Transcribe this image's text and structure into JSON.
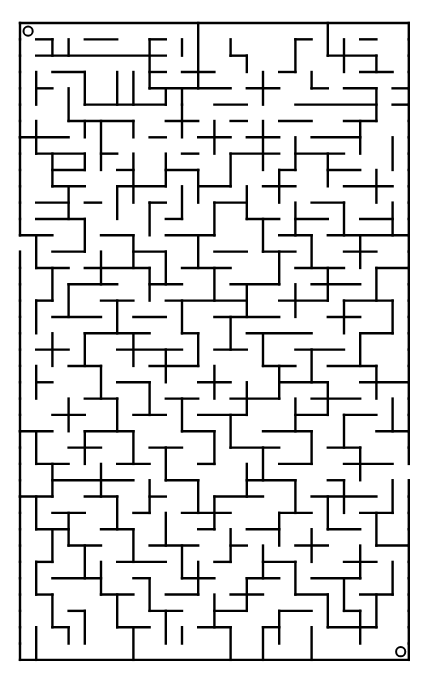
{
  "maze": {
    "cols": 24,
    "rows": 39,
    "origin": [
      20,
      23
    ],
    "cell_w": 16.2,
    "cell_h": 16.33,
    "colors": {
      "wall": "#000000",
      "background": "#ffffff"
    },
    "start_marker": {
      "cell": [
        0,
        0
      ],
      "shape": "circle"
    },
    "end_marker": {
      "cell": [
        23,
        38
      ],
      "shape": "circle"
    },
    "entrance_gaps": [
      {
        "side": "left",
        "row": 13
      },
      {
        "side": "right",
        "row": 27
      }
    ],
    "h_walls": [
      [
        1,
        1,
        2
      ],
      [
        4,
        1,
        6
      ],
      [
        8,
        1,
        9
      ],
      [
        17,
        1,
        18
      ],
      [
        21,
        1,
        22
      ],
      [
        1,
        2,
        9
      ],
      [
        13,
        2,
        14
      ],
      [
        19,
        2,
        22
      ],
      [
        2,
        3,
        4
      ],
      [
        8,
        3,
        9
      ],
      [
        10,
        3,
        12
      ],
      [
        16,
        3,
        17
      ],
      [
        21,
        3,
        23
      ],
      [
        1,
        4,
        2
      ],
      [
        8,
        4,
        13
      ],
      [
        14,
        4,
        16
      ],
      [
        18,
        4,
        19
      ],
      [
        20,
        4,
        22
      ],
      [
        23,
        4,
        24
      ],
      [
        4,
        5,
        9
      ],
      [
        12,
        5,
        14
      ],
      [
        17,
        5,
        22
      ],
      [
        23,
        5,
        24
      ],
      [
        3,
        6,
        7
      ],
      [
        9,
        6,
        11
      ],
      [
        13,
        6,
        14
      ],
      [
        16,
        6,
        18
      ],
      [
        20,
        6,
        22
      ],
      [
        0,
        7,
        3
      ],
      [
        8,
        7,
        9
      ],
      [
        11,
        7,
        13
      ],
      [
        14,
        7,
        16
      ],
      [
        18,
        7,
        21
      ],
      [
        1,
        8,
        4
      ],
      [
        5,
        8,
        6
      ],
      [
        10,
        8,
        11
      ],
      [
        13,
        8,
        16
      ],
      [
        17,
        8,
        20
      ],
      [
        2,
        9,
        4
      ],
      [
        6,
        9,
        7
      ],
      [
        9,
        9,
        11
      ],
      [
        16,
        9,
        17
      ],
      [
        19,
        9,
        21
      ],
      [
        2,
        10,
        4
      ],
      [
        6,
        10,
        9
      ],
      [
        11,
        10,
        13
      ],
      [
        15,
        10,
        17
      ],
      [
        20,
        10,
        23
      ],
      [
        1,
        11,
        3
      ],
      [
        4,
        11,
        5
      ],
      [
        8,
        11,
        9
      ],
      [
        12,
        11,
        14
      ],
      [
        18,
        11,
        20
      ],
      [
        1,
        12,
        4
      ],
      [
        9,
        12,
        10
      ],
      [
        14,
        12,
        16
      ],
      [
        17,
        12,
        19
      ],
      [
        21,
        12,
        23
      ],
      [
        0,
        13,
        2
      ],
      [
        5,
        13,
        7
      ],
      [
        9,
        13,
        12
      ],
      [
        16,
        13,
        18
      ],
      [
        19,
        13,
        24
      ],
      [
        2,
        14,
        4
      ],
      [
        7,
        14,
        9
      ],
      [
        12,
        14,
        14
      ],
      [
        15,
        14,
        17
      ],
      [
        20,
        14,
        22
      ],
      [
        1,
        15,
        3
      ],
      [
        4,
        15,
        8
      ],
      [
        10,
        15,
        13
      ],
      [
        17,
        15,
        20
      ],
      [
        22,
        15,
        24
      ],
      [
        3,
        16,
        6
      ],
      [
        8,
        16,
        10
      ],
      [
        13,
        16,
        16
      ],
      [
        18,
        16,
        21
      ],
      [
        1,
        17,
        2
      ],
      [
        5,
        17,
        7
      ],
      [
        9,
        17,
        14
      ],
      [
        16,
        17,
        19
      ],
      [
        20,
        17,
        23
      ],
      [
        2,
        18,
        5
      ],
      [
        7,
        18,
        9
      ],
      [
        12,
        18,
        16
      ],
      [
        19,
        18,
        21
      ],
      [
        4,
        19,
        8
      ],
      [
        10,
        19,
        11
      ],
      [
        14,
        19,
        18
      ],
      [
        21,
        19,
        23
      ],
      [
        1,
        20,
        3
      ],
      [
        6,
        20,
        10
      ],
      [
        12,
        20,
        14
      ],
      [
        17,
        20,
        20
      ],
      [
        3,
        21,
        5
      ],
      [
        8,
        21,
        11
      ],
      [
        15,
        21,
        17
      ],
      [
        19,
        21,
        22
      ],
      [
        1,
        22,
        2
      ],
      [
        6,
        22,
        8
      ],
      [
        11,
        22,
        13
      ],
      [
        16,
        22,
        19
      ],
      [
        21,
        22,
        24
      ],
      [
        4,
        23,
        6
      ],
      [
        9,
        23,
        11
      ],
      [
        13,
        23,
        16
      ],
      [
        18,
        23,
        21
      ],
      [
        2,
        24,
        4
      ],
      [
        7,
        24,
        9
      ],
      [
        11,
        24,
        14
      ],
      [
        17,
        24,
        19
      ],
      [
        20,
        24,
        22
      ],
      [
        0,
        25,
        2
      ],
      [
        4,
        25,
        7
      ],
      [
        10,
        25,
        12
      ],
      [
        15,
        25,
        18
      ],
      [
        22,
        25,
        24
      ],
      [
        3,
        26,
        5
      ],
      [
        8,
        26,
        10
      ],
      [
        13,
        26,
        16
      ],
      [
        19,
        26,
        21
      ],
      [
        1,
        27,
        3
      ],
      [
        6,
        27,
        8
      ],
      [
        11,
        27,
        12
      ],
      [
        16,
        27,
        18
      ],
      [
        20,
        27,
        23
      ],
      [
        2,
        28,
        7
      ],
      [
        9,
        28,
        11
      ],
      [
        14,
        28,
        17
      ],
      [
        19,
        28,
        20
      ],
      [
        0,
        29,
        2
      ],
      [
        4,
        29,
        6
      ],
      [
        8,
        29,
        9
      ],
      [
        12,
        29,
        15
      ],
      [
        18,
        29,
        22
      ],
      [
        2,
        30,
        4
      ],
      [
        7,
        30,
        8
      ],
      [
        10,
        30,
        13
      ],
      [
        16,
        30,
        18
      ],
      [
        21,
        30,
        23
      ],
      [
        1,
        31,
        3
      ],
      [
        5,
        31,
        7
      ],
      [
        11,
        31,
        12
      ],
      [
        14,
        31,
        16
      ],
      [
        19,
        31,
        21
      ],
      [
        3,
        32,
        5
      ],
      [
        8,
        32,
        11
      ],
      [
        13,
        32,
        14
      ],
      [
        17,
        32,
        19
      ],
      [
        22,
        32,
        24
      ],
      [
        1,
        33,
        2
      ],
      [
        6,
        33,
        9
      ],
      [
        12,
        33,
        13
      ],
      [
        15,
        33,
        17
      ],
      [
        20,
        33,
        22
      ],
      [
        2,
        34,
        5
      ],
      [
        7,
        34,
        8
      ],
      [
        10,
        34,
        12
      ],
      [
        14,
        34,
        16
      ],
      [
        18,
        34,
        21
      ],
      [
        1,
        35,
        2
      ],
      [
        5,
        35,
        7
      ],
      [
        9,
        35,
        11
      ],
      [
        13,
        35,
        15
      ],
      [
        17,
        35,
        19
      ],
      [
        21,
        35,
        23
      ],
      [
        3,
        36,
        4
      ],
      [
        8,
        36,
        10
      ],
      [
        12,
        36,
        14
      ],
      [
        16,
        36,
        18
      ],
      [
        20,
        36,
        21
      ],
      [
        2,
        37,
        3
      ],
      [
        6,
        37,
        8
      ],
      [
        11,
        37,
        13
      ],
      [
        15,
        37,
        16
      ],
      [
        19,
        37,
        22
      ]
    ],
    "v_walls": [
      [
        2,
        1,
        2
      ],
      [
        3,
        1,
        2
      ],
      [
        8,
        1,
        4
      ],
      [
        10,
        1,
        2
      ],
      [
        11,
        0,
        4
      ],
      [
        13,
        1,
        2
      ],
      [
        14,
        2,
        3
      ],
      [
        17,
        1,
        3
      ],
      [
        19,
        0,
        2
      ],
      [
        20,
        1,
        3
      ],
      [
        22,
        2,
        3
      ],
      [
        1,
        3,
        5
      ],
      [
        3,
        4,
        6
      ],
      [
        4,
        3,
        5
      ],
      [
        6,
        3,
        5
      ],
      [
        7,
        3,
        5
      ],
      [
        9,
        4,
        5
      ],
      [
        10,
        4,
        5
      ],
      [
        15,
        3,
        5
      ],
      [
        18,
        3,
        4
      ],
      [
        22,
        4,
        6
      ],
      [
        1,
        6,
        8
      ],
      [
        4,
        6,
        7
      ],
      [
        5,
        6,
        9
      ],
      [
        7,
        6,
        7
      ],
      [
        10,
        5,
        7
      ],
      [
        12,
        6,
        8
      ],
      [
        15,
        6,
        9
      ],
      [
        17,
        7,
        9
      ],
      [
        21,
        6,
        8
      ],
      [
        23,
        7,
        9
      ],
      [
        2,
        8,
        10
      ],
      [
        4,
        8,
        9
      ],
      [
        7,
        8,
        11
      ],
      [
        9,
        8,
        10
      ],
      [
        11,
        9,
        11
      ],
      [
        13,
        8,
        10
      ],
      [
        16,
        9,
        11
      ],
      [
        19,
        8,
        10
      ],
      [
        22,
        9,
        11
      ],
      [
        3,
        10,
        12
      ],
      [
        6,
        10,
        12
      ],
      [
        8,
        11,
        13
      ],
      [
        10,
        10,
        12
      ],
      [
        12,
        11,
        13
      ],
      [
        14,
        10,
        12
      ],
      [
        17,
        11,
        13
      ],
      [
        20,
        11,
        13
      ],
      [
        23,
        11,
        13
      ],
      [
        1,
        13,
        15
      ],
      [
        4,
        12,
        14
      ],
      [
        7,
        13,
        15
      ],
      [
        9,
        14,
        16
      ],
      [
        11,
        13,
        15
      ],
      [
        15,
        12,
        14
      ],
      [
        18,
        13,
        15
      ],
      [
        21,
        13,
        15
      ],
      [
        2,
        15,
        17
      ],
      [
        5,
        14,
        16
      ],
      [
        8,
        15,
        17
      ],
      [
        12,
        15,
        17
      ],
      [
        14,
        16,
        18
      ],
      [
        16,
        14,
        16
      ],
      [
        19,
        15,
        17
      ],
      [
        22,
        15,
        17
      ],
      [
        1,
        17,
        19
      ],
      [
        3,
        16,
        18
      ],
      [
        6,
        17,
        19
      ],
      [
        10,
        17,
        19
      ],
      [
        13,
        18,
        20
      ],
      [
        17,
        16,
        18
      ],
      [
        20,
        17,
        19
      ],
      [
        23,
        17,
        19
      ],
      [
        2,
        19,
        21
      ],
      [
        4,
        19,
        21
      ],
      [
        7,
        19,
        21
      ],
      [
        9,
        20,
        22
      ],
      [
        11,
        19,
        21
      ],
      [
        15,
        19,
        21
      ],
      [
        18,
        20,
        22
      ],
      [
        21,
        19,
        21
      ],
      [
        1,
        21,
        23
      ],
      [
        5,
        21,
        23
      ],
      [
        8,
        22,
        24
      ],
      [
        12,
        21,
        23
      ],
      [
        14,
        22,
        24
      ],
      [
        16,
        21,
        23
      ],
      [
        19,
        22,
        24
      ],
      [
        22,
        21,
        23
      ],
      [
        3,
        23,
        25
      ],
      [
        6,
        23,
        25
      ],
      [
        10,
        23,
        25
      ],
      [
        13,
        24,
        26
      ],
      [
        17,
        23,
        25
      ],
      [
        20,
        24,
        26
      ],
      [
        23,
        23,
        25
      ],
      [
        1,
        25,
        27
      ],
      [
        4,
        25,
        27
      ],
      [
        7,
        25,
        27
      ],
      [
        9,
        26,
        28
      ],
      [
        12,
        25,
        27
      ],
      [
        15,
        26,
        28
      ],
      [
        18,
        25,
        27
      ],
      [
        21,
        26,
        28
      ],
      [
        2,
        27,
        29
      ],
      [
        5,
        27,
        29
      ],
      [
        8,
        28,
        30
      ],
      [
        11,
        28,
        30
      ],
      [
        14,
        27,
        29
      ],
      [
        17,
        28,
        30
      ],
      [
        20,
        28,
        30
      ],
      [
        23,
        28,
        30
      ],
      [
        1,
        29,
        31
      ],
      [
        3,
        30,
        32
      ],
      [
        6,
        29,
        31
      ],
      [
        9,
        30,
        32
      ],
      [
        12,
        29,
        31
      ],
      [
        16,
        30,
        32
      ],
      [
        19,
        29,
        31
      ],
      [
        22,
        30,
        32
      ],
      [
        2,
        31,
        33
      ],
      [
        4,
        32,
        34
      ],
      [
        7,
        31,
        33
      ],
      [
        10,
        32,
        34
      ],
      [
        13,
        31,
        33
      ],
      [
        15,
        32,
        34
      ],
      [
        18,
        31,
        33
      ],
      [
        21,
        32,
        34
      ],
      [
        1,
        33,
        35
      ],
      [
        5,
        33,
        35
      ],
      [
        8,
        34,
        36
      ],
      [
        11,
        33,
        35
      ],
      [
        14,
        34,
        36
      ],
      [
        17,
        33,
        35
      ],
      [
        20,
        34,
        36
      ],
      [
        23,
        33,
        35
      ],
      [
        2,
        35,
        37
      ],
      [
        4,
        36,
        38
      ],
      [
        6,
        35,
        37
      ],
      [
        9,
        36,
        38
      ],
      [
        12,
        35,
        37
      ],
      [
        16,
        36,
        38
      ],
      [
        19,
        35,
        37
      ],
      [
        22,
        35,
        37
      ],
      [
        1,
        37,
        39
      ],
      [
        3,
        37,
        38
      ],
      [
        7,
        37,
        39
      ],
      [
        10,
        37,
        38
      ],
      [
        13,
        37,
        39
      ],
      [
        15,
        37,
        39
      ],
      [
        18,
        37,
        39
      ],
      [
        21,
        36,
        38
      ]
    ]
  }
}
